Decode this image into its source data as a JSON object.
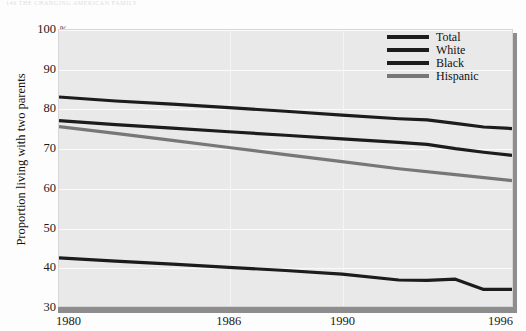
{
  "page": {
    "running_head": "146    THE CHANGING AMERICAN FAMILY"
  },
  "chart_data": {
    "type": "line",
    "title": "",
    "xlabel": "",
    "ylabel": "Proportion living with two parents",
    "unit_label": "%",
    "xlim": [
      1980,
      1996
    ],
    "ylim": [
      30,
      100
    ],
    "yticks": [
      100,
      90,
      80,
      70,
      60,
      50,
      40,
      30
    ],
    "xticks": [
      1980,
      1986,
      1990,
      1996
    ],
    "xtick_labels": [
      "1980",
      "1986",
      "1990",
      "1996"
    ],
    "ytick_labels": [
      "100",
      "90",
      "80",
      "70",
      "60",
      "50",
      "40",
      "30"
    ],
    "grid": true,
    "legend_position": "top-right",
    "series": [
      {
        "name": "Total",
        "color": "#1c1c1c",
        "width": 3.2,
        "x": [
          1980,
          1982,
          1984,
          1986,
          1988,
          1990,
          1992,
          1993,
          1994,
          1995,
          1996
        ],
        "values": [
          83.0,
          82.0,
          81.2,
          80.3,
          79.4,
          78.4,
          77.5,
          77.2,
          76.3,
          75.4,
          75.0
        ]
      },
      {
        "name": "White",
        "color": "#1c1c1c",
        "width": 3.2,
        "x": [
          1980,
          1982,
          1984,
          1986,
          1988,
          1990,
          1992,
          1993,
          1994,
          1995,
          1996
        ],
        "values": [
          77.0,
          76.0,
          75.1,
          74.2,
          73.3,
          72.4,
          71.5,
          71.0,
          69.9,
          69.0,
          68.2
        ]
      },
      {
        "name": "Black",
        "color": "#1c1c1c",
        "width": 3.2,
        "x": [
          1980,
          1982,
          1984,
          1986,
          1988,
          1990,
          1992,
          1993,
          1994,
          1995,
          1996
        ],
        "values": [
          42.2,
          41.4,
          40.6,
          39.8,
          39.0,
          38.1,
          36.6,
          36.5,
          36.8,
          34.2,
          34.2
        ]
      },
      {
        "name": "Hispanic",
        "color": "#777777",
        "width": 3.2,
        "x": [
          1980,
          1982,
          1984,
          1986,
          1988,
          1990,
          1992,
          1994,
          1996
        ],
        "values": [
          75.5,
          73.8,
          72.0,
          70.2,
          68.4,
          66.6,
          64.8,
          63.3,
          61.8
        ]
      }
    ]
  },
  "legend": {
    "items": [
      {
        "label": "Total",
        "color": "#1c1c1c"
      },
      {
        "label": "White",
        "color": "#1c1c1c"
      },
      {
        "label": "Black",
        "color": "#1c1c1c"
      },
      {
        "label": "Hispanic",
        "color": "#777777"
      }
    ]
  }
}
